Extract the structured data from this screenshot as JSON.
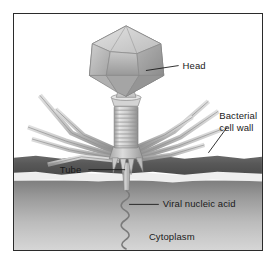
{
  "figure": {
    "frame_border_color": "#2b2b2b",
    "background_color": "#ffffff"
  },
  "labels": {
    "head": "Head",
    "bacterial_cell_wall_line1": "Bacterial",
    "bacterial_cell_wall_line2": "cell wall",
    "tube": "Tube",
    "viral_nucleic_acid": "Viral nucleic acid",
    "cytoplasm": "Cytoplasm"
  },
  "structures": {
    "head_name": "icosahedral-capsid",
    "collar_name": "collar",
    "sheath_name": "contractile-sheath",
    "baseplate_name": "baseplate",
    "tail_fibers_name": "tail-fibers",
    "tube_name": "tail-tube",
    "dna_name": "viral-dna-strand",
    "cell_wall_name": "bacterial-cell-wall",
    "membrane_name": "plasma-membrane",
    "cytoplasm_name": "cytoplasm-region"
  },
  "colors": {
    "cell_wall": "#5e5e5e",
    "cell_wall_dark": "#4a4a4a",
    "membrane": "#ececec",
    "cytoplasm_top": "#8e8e8e",
    "cytoplasm_bottom": "#d2d2d2",
    "capsid_light": "#d8d8d8",
    "capsid_mid": "#b4b4b4",
    "capsid_dark": "#939393",
    "capsid_edge": "#6e6e6e",
    "fiber": "#c4c4c4",
    "fiber_edge": "#8a8a8a",
    "sheath": "#cacaca",
    "label_text": "#1a1a1a",
    "leader_line": "#1a1a1a"
  }
}
